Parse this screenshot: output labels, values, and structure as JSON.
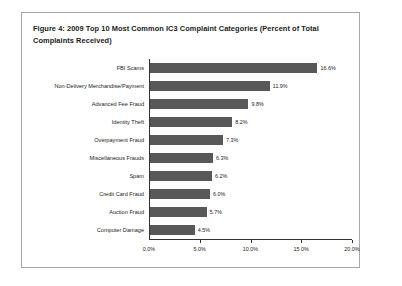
{
  "figure": {
    "title": "Figure 4: 2009 Top 10 Most Common IC3 Complaint Categories (Percent of Total Complaints Received)",
    "border_color": "#a8a8a8",
    "background_color": "#ffffff"
  },
  "chart_data": {
    "type": "bar",
    "orientation": "horizontal",
    "title": "Figure 4: 2009 Top 10 Most Common IC3 Complaint Categories (Percent of Total Complaints Received)",
    "xlabel": "",
    "ylabel": "",
    "xlim": [
      0,
      20
    ],
    "xticks": [
      0,
      5,
      10,
      15,
      20
    ],
    "xtick_labels": [
      "0.0%",
      "5.0%",
      "10.0%",
      "15.0%",
      "20.0%"
    ],
    "grid": false,
    "legend": false,
    "bar_color": "#585858",
    "categories": [
      "FBI Scams",
      "Non-Delivery Merchandise/Payment",
      "Advanced Fee Fraud",
      "Identity Theft",
      "Overpayment Fraud",
      "Miscellaneous Frauds",
      "Spam",
      "Credit Card Fraud",
      "Auction Fraud",
      "Computer Damage"
    ],
    "values": [
      16.6,
      11.9,
      9.8,
      8.2,
      7.3,
      6.3,
      6.2,
      6.0,
      5.7,
      4.5
    ],
    "value_labels": [
      "16.6%",
      "11.9%",
      "9.8%",
      "8.2%",
      "7.3%",
      "6.3%",
      "6.2%",
      "6.0%",
      "5.7%",
      "4.5%"
    ]
  }
}
